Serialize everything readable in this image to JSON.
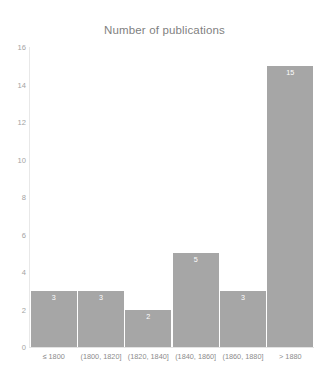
{
  "chart_data": {
    "type": "bar",
    "title": "Number of publications",
    "xlabel": "",
    "ylabel": "",
    "categories": [
      "≤ 1800",
      "(1800, 1820]",
      "(1820, 1840]",
      "(1840, 1860]",
      "(1860, 1880]",
      "> 1880"
    ],
    "values": [
      3,
      3,
      2,
      5,
      3,
      15
    ],
    "value_labels": [
      "3",
      "3",
      "2",
      "5",
      "3",
      "15"
    ],
    "ylim": [
      0,
      16
    ],
    "ytick_labels": [
      "16",
      "14",
      "12",
      "10",
      "8",
      "6",
      "4",
      "2",
      "0"
    ],
    "ytick_values": [
      16,
      14,
      12,
      10,
      8,
      6,
      4,
      2,
      0
    ],
    "grid": false,
    "legend": null,
    "bar_color": "#a6a6a6",
    "label_color": "#ffffff",
    "axis_text_color": "#a3a3a3",
    "title_color": "#7f7f7f",
    "background_color": "#ffffff"
  }
}
